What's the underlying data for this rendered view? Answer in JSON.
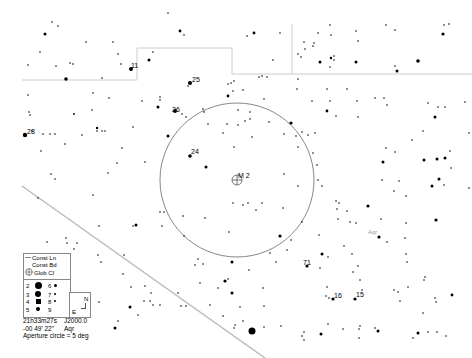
{
  "map": {
    "object_label": "M 2",
    "constellation_label": "Aqr",
    "star_labels": [
      {
        "text": "11",
        "x": 131,
        "y": 63
      },
      {
        "text": "25",
        "x": 191,
        "y": 77
      },
      {
        "text": "26",
        "x": 172,
        "y": 107
      },
      {
        "text": "28",
        "x": 28,
        "y": 129
      },
      {
        "text": "24",
        "x": 191,
        "y": 149
      },
      {
        "text": "71",
        "x": 303,
        "y": 260
      },
      {
        "text": "16",
        "x": 334,
        "y": 293
      },
      {
        "text": "15",
        "x": 356,
        "y": 292
      }
    ],
    "aperture_circle": {
      "cx": 237,
      "cy": 180,
      "r": 77,
      "color": "#888888"
    },
    "ecliptic_color": "#bbbbbb",
    "boundary_color": "#cccccc"
  },
  "legend": {
    "items": [
      "Const Ln",
      "Const Bd",
      "Glob Cl"
    ],
    "magnitudes_left": [
      "2",
      "3",
      "4",
      "5"
    ],
    "magnitudes_right": [
      "6",
      "7",
      "8",
      "9"
    ],
    "compass": {
      "north": "N",
      "east": "E"
    }
  },
  "info": {
    "ra": "21h33m27s",
    "epoch": "J2000.0",
    "dec": "-00 49' 22\"",
    "constellation": "Aqr",
    "aperture": "Aperture circle = 5 deg"
  }
}
